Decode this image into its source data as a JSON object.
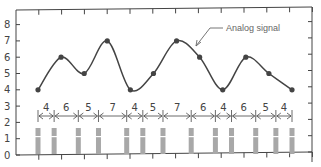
{
  "chart_data": {
    "type": "line",
    "title": "",
    "xlabel": "",
    "ylabel": "",
    "ylim": [
      0,
      8.5
    ],
    "yticks": [
      0,
      1,
      2,
      3,
      4,
      5,
      6,
      7,
      8
    ],
    "grid": false,
    "annotation": "Analog signal",
    "series": [
      {
        "name": "Analog signal samples",
        "values": [
          4,
          6,
          5,
          7,
          4,
          5,
          7,
          6,
          4,
          6,
          5,
          4
        ]
      }
    ],
    "pulse_intervals": [
      4,
      6,
      5,
      7,
      4,
      5,
      7,
      6,
      4,
      6,
      5,
      4
    ],
    "pulse_count": 13
  },
  "labels": {
    "y": [
      "0",
      "1",
      "2",
      "3",
      "4",
      "5",
      "6",
      "7",
      "8"
    ],
    "annotation": "Analog signal",
    "intervals": [
      "4",
      "6",
      "5",
      "7",
      "4",
      "5",
      "7",
      "6",
      "4",
      "6",
      "5",
      "4"
    ]
  }
}
